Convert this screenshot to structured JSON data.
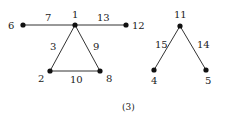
{
  "figure": {
    "caption": "(3)",
    "nodes": [
      {
        "id": "6",
        "label": "6",
        "x": 23,
        "y": 25,
        "lx": 8,
        "ly": 29
      },
      {
        "id": "1",
        "label": "1",
        "x": 75,
        "y": 25,
        "lx": 72,
        "ly": 18
      },
      {
        "id": "12",
        "label": "12",
        "x": 126,
        "y": 25,
        "lx": 132,
        "ly": 29
      },
      {
        "id": "2",
        "label": "2",
        "x": 50,
        "y": 71,
        "lx": 38,
        "ly": 82
      },
      {
        "id": "8",
        "label": "8",
        "x": 100,
        "y": 71,
        "lx": 106,
        "ly": 82
      },
      {
        "id": "11",
        "label": "11",
        "x": 180,
        "y": 26,
        "lx": 174,
        "ly": 18
      },
      {
        "id": "4",
        "label": "4",
        "x": 154,
        "y": 70,
        "lx": 151,
        "ly": 84
      },
      {
        "id": "5",
        "label": "5",
        "x": 206,
        "y": 70,
        "lx": 205,
        "ly": 84
      }
    ],
    "edges": [
      {
        "from": "6",
        "to": "1",
        "weight": "7",
        "lx": 45,
        "ly": 21
      },
      {
        "from": "1",
        "to": "12",
        "weight": "13",
        "lx": 97,
        "ly": 21
      },
      {
        "from": "1",
        "to": "2",
        "weight": "3",
        "lx": 50,
        "ly": 50
      },
      {
        "from": "1",
        "to": "8",
        "weight": "9",
        "lx": 93,
        "ly": 50
      },
      {
        "from": "2",
        "to": "8",
        "weight": "10",
        "lx": 70,
        "ly": 83
      },
      {
        "from": "11",
        "to": "4",
        "weight": "15",
        "lx": 155,
        "ly": 48
      },
      {
        "from": "11",
        "to": "5",
        "weight": "14",
        "lx": 197,
        "ly": 48
      }
    ]
  }
}
